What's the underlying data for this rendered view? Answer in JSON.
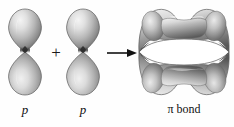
{
  "figure": {
    "background_color": "#fefefe",
    "width": 234,
    "height": 127
  },
  "operators": {
    "plus": "+",
    "arrow": "→",
    "plus_name": "plus-operator",
    "arrow_name": "reaction-arrow"
  },
  "orbitals": [
    {
      "id": "p-orbital-1",
      "label": "p",
      "type": "p-orbital",
      "lobes": 2,
      "orientation": "vertical",
      "description": "Two teardrop lobes meeting at a central node point"
    },
    {
      "id": "p-orbital-2",
      "label": "p",
      "type": "p-orbital",
      "lobes": 2,
      "orientation": "vertical",
      "description": "Two teardrop lobes meeting at a central node point"
    },
    {
      "id": "pi-orbital",
      "label_pi": "π",
      "label_rest": " bond",
      "label_full": "π bond",
      "type": "pi-molecular-orbital",
      "lobes": 2,
      "orientation": "horizontal",
      "description": "Two bone-shaped lobes above and below a horizontal nodal plane, pointed at left and right tips"
    }
  ],
  "colors": {
    "background": "#fefefe",
    "highlight": "#f2f2f2",
    "midtone": "#b4b4b4",
    "shadow": "#6a6a6a",
    "deep_shadow": "#2e2e2e",
    "outline": "#555555",
    "text": "#111111"
  }
}
